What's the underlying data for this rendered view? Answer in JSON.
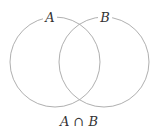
{
  "diagram": {
    "type": "venn",
    "sets": [
      {
        "label": "A",
        "cx": 55,
        "cy": 62,
        "r": 45
      },
      {
        "label": "B",
        "cx": 104,
        "cy": 62,
        "r": 45
      }
    ],
    "caption": "A ∩ B",
    "stroke_color": "#b0b0b0",
    "background": "#ffffff"
  }
}
